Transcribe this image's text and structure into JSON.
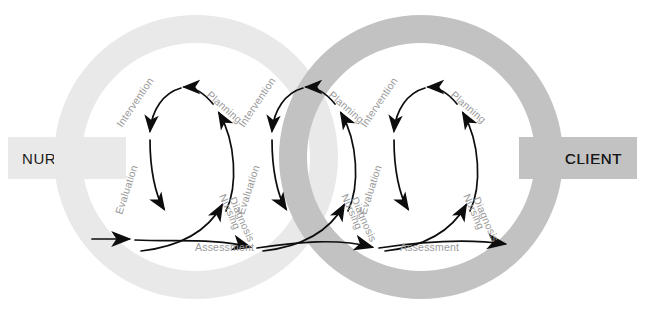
{
  "diagram": {
    "type": "process-cycle-diagram",
    "colors": {
      "nurse_ring": "#e9e9e9",
      "client_ring": "#c2c2c2",
      "overlap_ring": "#b3b3b3",
      "nurse_tab": "#e9e9e9",
      "client_tab": "#c2c2c2",
      "stroke": "#000000",
      "label_text": "#9a9a9a",
      "endpoint_text": "#1a1a1a",
      "background": "#ffffff"
    },
    "endpoints": {
      "left": {
        "label": "NURSE",
        "tab_fill": "#e9e9e9"
      },
      "right": {
        "label": "CLIENT",
        "tab_fill": "#c2c2c2"
      }
    },
    "rings": [
      {
        "name": "nurse-ring",
        "cx": 196,
        "cy": 157,
        "outer_r": 142,
        "inner_r": 114,
        "fill": "#e9e9e9"
      },
      {
        "name": "client-ring",
        "cx": 421,
        "cy": 157,
        "outer_r": 142,
        "inner_r": 114,
        "fill": "#c2c2c2"
      }
    ],
    "cycles": [
      {
        "name": "cycle-1",
        "center_x": 186,
        "steps": [
          "Assessment",
          "Nursing Diagnosis",
          "Planning",
          "Intervention",
          "Evaluation"
        ]
      },
      {
        "name": "cycle-2",
        "center_x": 308,
        "steps": [
          "Assessment",
          "Nursing Diagnosis",
          "Planning",
          "Intervention",
          "Evaluation"
        ]
      },
      {
        "name": "cycle-3",
        "center_x": 430,
        "steps": [
          "Assessment",
          "Nursing Diagnosis",
          "Planning",
          "Intervention",
          "Evaluation"
        ]
      }
    ],
    "labels": {
      "assessment": "Assessment",
      "nursing_diagnosis_line1": "Nursing",
      "nursing_diagnosis_line2": "Diagnosis",
      "planning": "Planning",
      "intervention": "Intervention",
      "evaluation": "Evaluation"
    }
  }
}
